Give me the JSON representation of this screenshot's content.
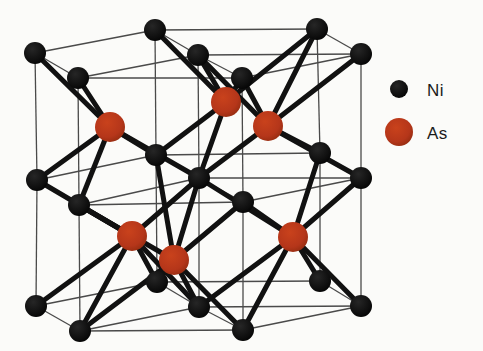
{
  "figure": {
    "kind": "crystal-structure-diagram",
    "compound": "NiAs",
    "background_color": "#fbfbf9",
    "canvas": {
      "width": 483,
      "height": 351
    }
  },
  "legend": {
    "position": "right",
    "entries": [
      {
        "id": "ni",
        "label": "Ni",
        "color": "#0d0d0d",
        "radius": 9,
        "marker_x": 399,
        "marker_y": 89,
        "label_x": 427,
        "label_y": 96
      },
      {
        "id": "as",
        "label": "As",
        "color": "#b8371a",
        "radius": 14,
        "marker_x": 399,
        "marker_y": 132,
        "label_x": 427,
        "label_y": 139
      }
    ]
  },
  "style": {
    "ni_color": "#0d0d0d",
    "as_color": "#b8371a",
    "as_color_dark": "#8e2a0e",
    "bond_color": "#111111",
    "cell_edge_color": "#4a4a4a",
    "ni_radius": 11,
    "as_radius": 15,
    "bond_width": 5,
    "cell_edge_width": 1.3
  },
  "atoms": {
    "ni": [
      {
        "id": "ni-top-back-left",
        "x": 35,
        "y": 53
      },
      {
        "id": "ni-top-back-mid",
        "x": 155,
        "y": 30
      },
      {
        "id": "ni-top-back-right",
        "x": 317,
        "y": 29
      },
      {
        "id": "ni-top-mid-left",
        "x": 78,
        "y": 78
      },
      {
        "id": "ni-top-mid-center",
        "x": 198,
        "y": 55
      },
      {
        "id": "ni-top-mid-right",
        "x": 361,
        "y": 54
      },
      {
        "id": "ni-top-front-center",
        "x": 242,
        "y": 78
      },
      {
        "id": "ni-mid-back-left",
        "x": 37,
        "y": 180
      },
      {
        "id": "ni-mid-back-mid",
        "x": 156,
        "y": 155
      },
      {
        "id": "ni-mid-back-right",
        "x": 320,
        "y": 153
      },
      {
        "id": "ni-mid-left",
        "x": 79,
        "y": 205
      },
      {
        "id": "ni-mid-center",
        "x": 199,
        "y": 178
      },
      {
        "id": "ni-mid-right",
        "x": 361,
        "y": 178
      },
      {
        "id": "ni-mid-front-center",
        "x": 243,
        "y": 202
      },
      {
        "id": "ni-bot-back-left",
        "x": 36,
        "y": 306
      },
      {
        "id": "ni-bot-back-mid",
        "x": 157,
        "y": 282
      },
      {
        "id": "ni-bot-back-right",
        "x": 320,
        "y": 281
      },
      {
        "id": "ni-bot-left",
        "x": 80,
        "y": 331
      },
      {
        "id": "ni-bot-center",
        "x": 199,
        "y": 307
      },
      {
        "id": "ni-bot-right",
        "x": 361,
        "y": 306
      },
      {
        "id": "ni-bot-front-center",
        "x": 243,
        "y": 330
      }
    ],
    "as": [
      {
        "id": "as-upper-left",
        "x": 110,
        "y": 127
      },
      {
        "id": "as-upper-mid",
        "x": 226,
        "y": 102
      },
      {
        "id": "as-upper-right",
        "x": 268,
        "y": 126
      },
      {
        "id": "as-lower-left",
        "x": 132,
        "y": 236
      },
      {
        "id": "as-lower-mid",
        "x": 174,
        "y": 260
      },
      {
        "id": "as-lower-right",
        "x": 293,
        "y": 237
      }
    ]
  },
  "cell_edges": [
    [
      35,
      53,
      155,
      30
    ],
    [
      155,
      30,
      317,
      29
    ],
    [
      317,
      29,
      361,
      54
    ],
    [
      361,
      54,
      242,
      78
    ],
    [
      242,
      78,
      78,
      78
    ],
    [
      78,
      78,
      35,
      53
    ],
    [
      155,
      30,
      198,
      55
    ],
    [
      198,
      55,
      242,
      78
    ],
    [
      198,
      55,
      78,
      78
    ],
    [
      198,
      55,
      361,
      54
    ],
    [
      35,
      53,
      37,
      180
    ],
    [
      37,
      180,
      36,
      306
    ],
    [
      78,
      78,
      79,
      205
    ],
    [
      79,
      205,
      80,
      331
    ],
    [
      155,
      30,
      156,
      155
    ],
    [
      156,
      155,
      157,
      282
    ],
    [
      198,
      55,
      199,
      178
    ],
    [
      199,
      178,
      199,
      307
    ],
    [
      242,
      78,
      243,
      202
    ],
    [
      243,
      202,
      243,
      330
    ],
    [
      317,
      29,
      320,
      153
    ],
    [
      320,
      153,
      320,
      281
    ],
    [
      361,
      54,
      361,
      178
    ],
    [
      361,
      178,
      361,
      306
    ],
    [
      37,
      180,
      156,
      155
    ],
    [
      156,
      155,
      320,
      153
    ],
    [
      320,
      153,
      361,
      178
    ],
    [
      361,
      178,
      243,
      202
    ],
    [
      243,
      202,
      79,
      205
    ],
    [
      79,
      205,
      37,
      180
    ],
    [
      156,
      155,
      199,
      178
    ],
    [
      199,
      178,
      243,
      202
    ],
    [
      199,
      178,
      79,
      205
    ],
    [
      199,
      178,
      361,
      178
    ],
    [
      36,
      306,
      157,
      282
    ],
    [
      157,
      282,
      320,
      281
    ],
    [
      320,
      281,
      361,
      306
    ],
    [
      361,
      306,
      243,
      330
    ],
    [
      243,
      330,
      80,
      331
    ],
    [
      80,
      331,
      36,
      306
    ],
    [
      157,
      282,
      199,
      307
    ],
    [
      199,
      307,
      243,
      330
    ],
    [
      199,
      307,
      80,
      331
    ],
    [
      199,
      307,
      361,
      306
    ]
  ],
  "bonds": [
    [
      35,
      53,
      110,
      127
    ],
    [
      78,
      78,
      110,
      127
    ],
    [
      37,
      180,
      110,
      127
    ],
    [
      79,
      205,
      110,
      127
    ],
    [
      199,
      178,
      110,
      127
    ],
    [
      156,
      155,
      110,
      127
    ],
    [
      155,
      30,
      226,
      102
    ],
    [
      198,
      55,
      226,
      102
    ],
    [
      317,
      29,
      226,
      102
    ],
    [
      242,
      78,
      226,
      102
    ],
    [
      156,
      155,
      226,
      102
    ],
    [
      199,
      178,
      226,
      102
    ],
    [
      198,
      55,
      268,
      126
    ],
    [
      242,
      78,
      268,
      126
    ],
    [
      317,
      29,
      268,
      126
    ],
    [
      361,
      54,
      268,
      126
    ],
    [
      199,
      178,
      268,
      126
    ],
    [
      320,
      153,
      268,
      126
    ],
    [
      361,
      178,
      268,
      126
    ],
    [
      37,
      180,
      132,
      236
    ],
    [
      79,
      205,
      132,
      236
    ],
    [
      36,
      306,
      132,
      236
    ],
    [
      80,
      331,
      132,
      236
    ],
    [
      199,
      307,
      132,
      236
    ],
    [
      157,
      282,
      132,
      236
    ],
    [
      199,
      178,
      132,
      236
    ],
    [
      156,
      155,
      174,
      260
    ],
    [
      199,
      178,
      174,
      260
    ],
    [
      243,
      202,
      174,
      260
    ],
    [
      79,
      205,
      174,
      260
    ],
    [
      157,
      282,
      174,
      260
    ],
    [
      199,
      307,
      174,
      260
    ],
    [
      243,
      330,
      174,
      260
    ],
    [
      80,
      331,
      174,
      260
    ],
    [
      199,
      178,
      293,
      237
    ],
    [
      243,
      202,
      293,
      237
    ],
    [
      320,
      153,
      293,
      237
    ],
    [
      361,
      178,
      293,
      237
    ],
    [
      320,
      281,
      293,
      237
    ],
    [
      361,
      306,
      293,
      237
    ],
    [
      243,
      330,
      293,
      237
    ],
    [
      199,
      307,
      293,
      237
    ]
  ]
}
